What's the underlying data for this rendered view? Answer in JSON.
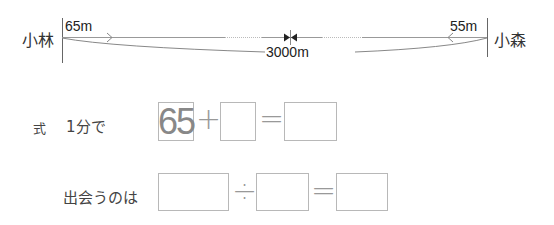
{
  "diagram": {
    "left_person": "小林",
    "right_person": "小森",
    "left_speed": "65m",
    "right_speed": "55m",
    "total_distance": "3000m",
    "colors": {
      "line": "#888888",
      "box_border": "#b8b8b8",
      "given_text": "#888888"
    }
  },
  "equation1": {
    "prefix": "式",
    "label": "1分で",
    "operand1": "65",
    "operator1": "+",
    "operand2": "",
    "equals": "=",
    "result": ""
  },
  "equation2": {
    "label": "出会うのは",
    "operand1": "",
    "operator1": "÷",
    "operand2": "",
    "equals": "=",
    "result": ""
  }
}
